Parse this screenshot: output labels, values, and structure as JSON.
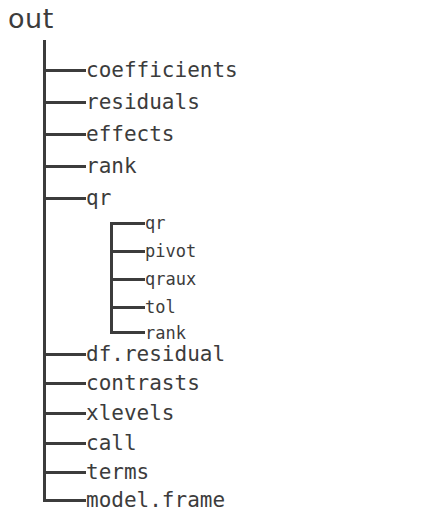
{
  "diagram": {
    "type": "tree",
    "root": {
      "label": "out"
    },
    "colors": {
      "text": "#3c3c3c",
      "line": "#3c3c3c",
      "background": "#ffffff"
    },
    "nodes": [
      {
        "label": "coefficients",
        "level": 1,
        "connector": "tee"
      },
      {
        "label": "residuals",
        "level": 1,
        "connector": "tee"
      },
      {
        "label": "effects",
        "level": 1,
        "connector": "tee"
      },
      {
        "label": "rank",
        "level": 1,
        "connector": "tee"
      },
      {
        "label": "qr",
        "level": 1,
        "connector": "tee"
      },
      {
        "label": "qr",
        "level": 2,
        "connector": "elbow-top"
      },
      {
        "label": "pivot",
        "level": 2,
        "connector": "tee"
      },
      {
        "label": "qraux",
        "level": 2,
        "connector": "tee"
      },
      {
        "label": "tol",
        "level": 2,
        "connector": "tee"
      },
      {
        "label": "rank",
        "level": 2,
        "connector": "elbow-bottom"
      },
      {
        "label": "df.residual",
        "level": 1,
        "connector": "tee"
      },
      {
        "label": "contrasts",
        "level": 1,
        "connector": "tee"
      },
      {
        "label": "xlevels",
        "level": 1,
        "connector": "tee"
      },
      {
        "label": "call",
        "level": 1,
        "connector": "tee"
      },
      {
        "label": "terms",
        "level": 1,
        "connector": "tee"
      },
      {
        "label": "model.frame",
        "level": 1,
        "connector": "elbow-bottom"
      }
    ]
  }
}
